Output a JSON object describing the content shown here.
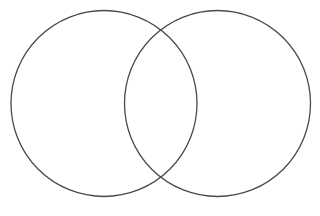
{
  "diagram": {
    "type": "venn",
    "set_count": 2,
    "sets": [
      {
        "id": "left",
        "label": ""
      },
      {
        "id": "right",
        "label": ""
      }
    ],
    "intersection_label": "",
    "colors": {
      "background": "#ffffff",
      "outline": "#4a4a4a"
    }
  }
}
